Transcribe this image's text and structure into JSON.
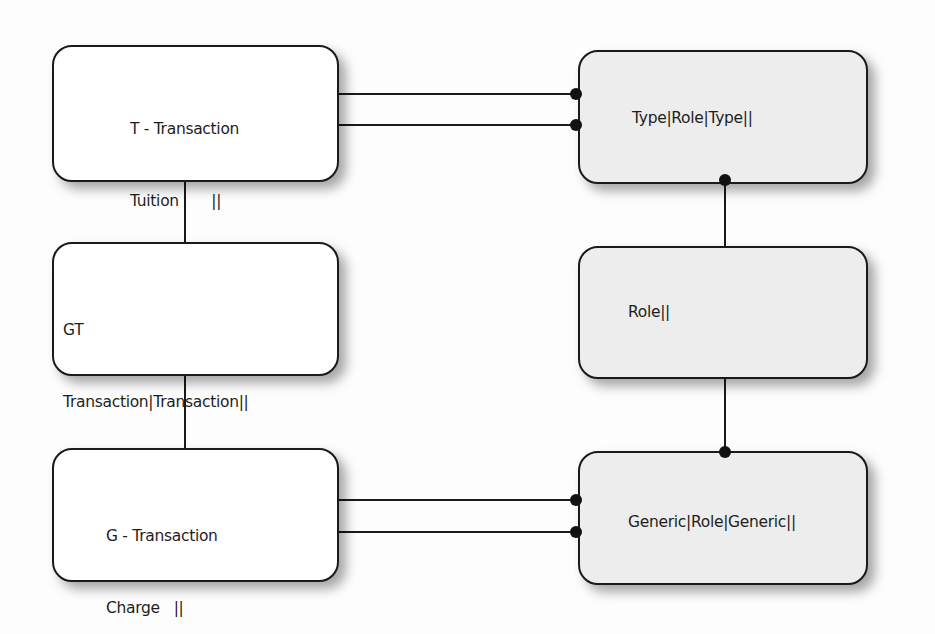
{
  "diagram": {
    "type": "entity-relationship",
    "colors": {
      "line": "#1a1a1a",
      "left_box_fill": "#ffffff",
      "right_box_fill": "#ededed",
      "text": "#1e1e1e"
    },
    "left_boxes": [
      {
        "id": "t-transaction",
        "title": "T - Transaction",
        "lines": [
          "Tuition       ||",
          "Cash           ||",
          "Transaction||"
        ]
      },
      {
        "id": "gt",
        "title": "GT",
        "lines": [
          "Transaction|Transaction||",
          "Charge      |Tuition        ||",
          "Payment    |Cash            ||"
        ]
      },
      {
        "id": "g-transaction",
        "title": "G - Transaction",
        "lines": [
          "Charge   ||",
          "Payment||"
        ]
      }
    ],
    "right_boxes": [
      {
        "id": "type-role-type",
        "label": "Type|Role|Type||"
      },
      {
        "id": "role",
        "label": "Role||"
      },
      {
        "id": "generic-role-generic",
        "label": "Generic|Role|Generic||"
      }
    ],
    "connections": [
      {
        "from": "t-transaction",
        "to": "type-role-type",
        "end": "dot"
      },
      {
        "from": "t-transaction",
        "to": "type-role-type",
        "end": "dot"
      },
      {
        "from": "t-transaction",
        "to": "gt",
        "end": "plain"
      },
      {
        "from": "gt",
        "to": "g-transaction",
        "end": "plain"
      },
      {
        "from": "g-transaction",
        "to": "generic-role-generic",
        "end": "dot"
      },
      {
        "from": "g-transaction",
        "to": "generic-role-generic",
        "end": "dot"
      },
      {
        "from": "type-role-type",
        "to": "role",
        "end": "dot"
      },
      {
        "from": "role",
        "to": "generic-role-generic",
        "end": "dot"
      }
    ]
  }
}
